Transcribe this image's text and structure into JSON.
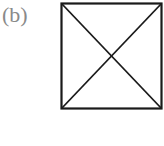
{
  "figure": {
    "label": "(b)",
    "shape": "square-with-diagonals",
    "stroke_color": "#1a1a1a",
    "label_color": "#8a8a8a"
  }
}
